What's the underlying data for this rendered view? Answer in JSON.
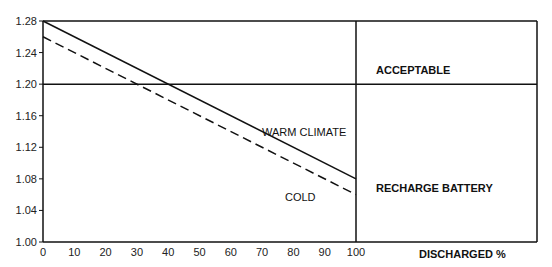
{
  "chart_data": {
    "type": "line",
    "title": "",
    "xlabel": "DISCHARGED %",
    "ylabel": "",
    "xlim": [
      0,
      100
    ],
    "ylim": [
      1.0,
      1.28
    ],
    "x_ticks": [
      0,
      10,
      20,
      30,
      40,
      50,
      60,
      70,
      80,
      90,
      100
    ],
    "y_ticks": [
      "1.00",
      "1.04",
      "1.08",
      "1.12",
      "1.16",
      "1.20",
      "1.24",
      "1.28"
    ],
    "series": [
      {
        "name": "WARM CLIMATE",
        "style": "solid",
        "x": [
          0,
          100
        ],
        "y": [
          1.28,
          1.08
        ]
      },
      {
        "name": "COLD",
        "style": "dashed",
        "x": [
          0,
          100
        ],
        "y": [
          1.26,
          1.06
        ]
      }
    ],
    "threshold": {
      "y": 1.2
    },
    "regions": {
      "above": "ACCEPTABLE",
      "below": "RECHARGE BATTERY"
    },
    "grid": false,
    "legend": "none"
  }
}
